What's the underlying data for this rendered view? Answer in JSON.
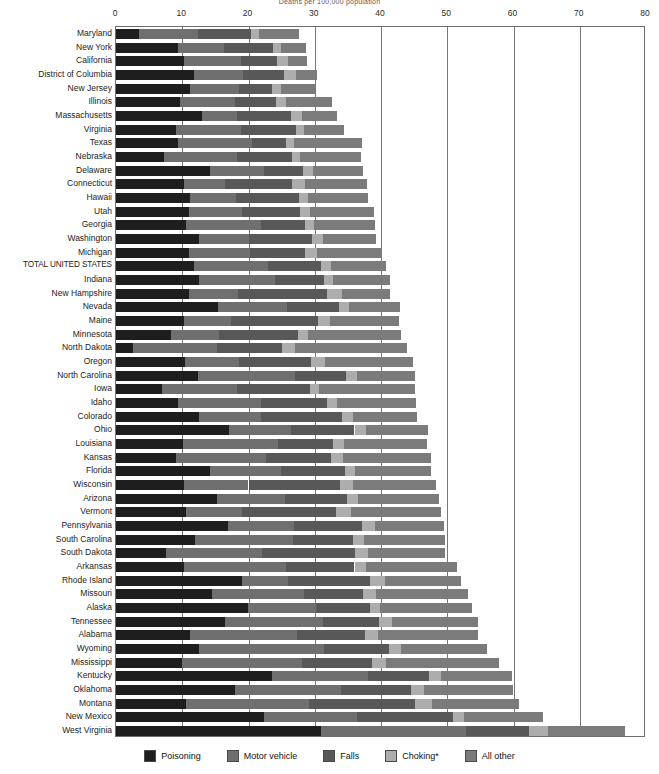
{
  "chart_data": {
    "type": "bar",
    "orientation": "horizontal",
    "stacked": true,
    "title": "",
    "subtitle": "Deaths per 100,000 population",
    "xlabel": "",
    "ylabel": "",
    "xlim": [
      0,
      80
    ],
    "xticks": [
      0,
      10,
      20,
      30,
      40,
      50,
      60,
      70,
      80
    ],
    "grid": "vertical",
    "legend_position": "bottom",
    "series": [
      {
        "name": "Poisoning",
        "color": "#1e1e1e"
      },
      {
        "name": "Motor vehicle",
        "color": "#6f6f6f"
      },
      {
        "name": "Falls",
        "color": "#585858"
      },
      {
        "name": "Choking*",
        "color": "#adadad"
      },
      {
        "name": "All other",
        "color": "#7b7b7b"
      }
    ],
    "categories": [
      "Maryland",
      "New York",
      "California",
      "District of Columbia",
      "New Jersey",
      "Illinois",
      "Massachusetts",
      "Virginia",
      "Texas",
      "Nebraska",
      "Delaware",
      "Connecticut",
      "Hawaii",
      "Utah",
      "Georgia",
      "Washington",
      "Michigan",
      "TOTAL UNITED STATES",
      "Indiana",
      "New Hampshire",
      "Nevada",
      "Maine",
      "Minnesota",
      "North Dakota",
      "Oregon",
      "North Carolina",
      "Iowa",
      "Idaho",
      "Colorado",
      "Ohio",
      "Louisiana",
      "Kansas",
      "Florida",
      "Wisconsin",
      "Arizona",
      "Vermont",
      "Pennsylvania",
      "South Carolina",
      "South Dakota",
      "Arkansas",
      "Rhode Island",
      "Missouri",
      "Alaska",
      "Tennessee",
      "Alabama",
      "Wyoming",
      "Mississippi",
      "Kentucky",
      "Oklahoma",
      "Montana",
      "New Mexico",
      "West Virginia"
    ],
    "values": [
      [
        3.5,
        8.9,
        8.0,
        1.2,
        6.0
      ],
      [
        9.4,
        6.9,
        7.4,
        1.2,
        3.8
      ],
      [
        10.3,
        8.6,
        5.4,
        1.7,
        2.8
      ],
      [
        11.8,
        7.3,
        6.2,
        1.9,
        3.2
      ],
      [
        11.1,
        7.4,
        5.1,
        1.3,
        5.2
      ],
      [
        9.7,
        8.3,
        6.2,
        1.4,
        7.0
      ],
      [
        13.0,
        5.2,
        8.2,
        1.7,
        5.3
      ],
      [
        9.1,
        9.7,
        8.3,
        1.3,
        6.0
      ],
      [
        9.3,
        11.2,
        5.2,
        1.2,
        10.2
      ],
      [
        7.2,
        11.1,
        8.2,
        1.2,
        9.3
      ],
      [
        14.2,
        8.1,
        5.9,
        1.5,
        7.6
      ],
      [
        10.2,
        6.2,
        10.1,
        2.1,
        9.3
      ],
      [
        11.1,
        7.0,
        9.5,
        1.4,
        9.1
      ],
      [
        11.0,
        8.0,
        8.8,
        1.5,
        9.7
      ],
      [
        10.5,
        11.4,
        6.6,
        1.4,
        9.2
      ],
      [
        12.5,
        7.5,
        9.6,
        1.7,
        8.0
      ],
      [
        11.0,
        9.2,
        8.4,
        1.7,
        9.9
      ],
      [
        11.8,
        11.1,
        8.0,
        1.5,
        8.3
      ],
      [
        12.6,
        11.4,
        7.4,
        1.4,
        8.5
      ],
      [
        11.0,
        7.4,
        13.4,
        2.3,
        7.2
      ],
      [
        15.4,
        10.4,
        7.9,
        1.4,
        7.7
      ],
      [
        10.2,
        7.2,
        13.1,
        1.8,
        10.4
      ],
      [
        8.3,
        7.3,
        11.8,
        1.6,
        14.0
      ],
      [
        2.5,
        12.7,
        9.9,
        1.9,
        16.9
      ],
      [
        10.4,
        8.2,
        10.9,
        2.0,
        13.3
      ],
      [
        12.4,
        14.6,
        7.7,
        1.7,
        8.7
      ],
      [
        6.9,
        11.4,
        11.0,
        1.4,
        14.4
      ],
      [
        9.4,
        12.5,
        9.9,
        1.5,
        12.0
      ],
      [
        12.6,
        9.3,
        12.2,
        1.7,
        9.7
      ],
      [
        17.0,
        9.4,
        9.6,
        1.7,
        9.4
      ],
      [
        10.1,
        14.3,
        8.4,
        1.6,
        12.5
      ],
      [
        9.0,
        13.7,
        9.8,
        1.8,
        13.2
      ],
      [
        14.2,
        10.7,
        9.6,
        1.6,
        11.5
      ],
      [
        10.2,
        9.8,
        13.8,
        1.9,
        12.6
      ],
      [
        15.2,
        10.3,
        9.4,
        1.6,
        12.3
      ],
      [
        10.5,
        8.5,
        14.2,
        2.2,
        13.7
      ],
      [
        16.9,
        9.9,
        10.3,
        2.0,
        10.4
      ],
      [
        11.9,
        14.8,
        9.0,
        1.7,
        12.3
      ],
      [
        7.5,
        14.5,
        14.0,
        2.0,
        11.6
      ],
      [
        10.3,
        15.3,
        10.4,
        1.7,
        13.7
      ],
      [
        19.0,
        6.9,
        12.5,
        2.2,
        11.5
      ],
      [
        14.5,
        13.9,
        8.9,
        2.0,
        13.9
      ],
      [
        19.9,
        10.3,
        8.2,
        1.5,
        13.8
      ],
      [
        16.5,
        14.8,
        8.4,
        2.0,
        13.0
      ],
      [
        11.1,
        16.2,
        10.3,
        2.0,
        15.0
      ],
      [
        12.6,
        18.8,
        9.8,
        1.8,
        13.0
      ],
      [
        9.9,
        18.2,
        10.6,
        2.0,
        17.1
      ],
      [
        23.6,
        14.4,
        9.2,
        1.9,
        10.6
      ],
      [
        18.0,
        16.0,
        10.5,
        2.0,
        13.4
      ],
      [
        10.5,
        18.6,
        16.1,
        2.5,
        13.2
      ],
      [
        22.4,
        14.0,
        14.4,
        1.8,
        11.9
      ],
      [
        31.0,
        21.9,
        9.4,
        2.9,
        11.6
      ]
    ]
  },
  "legend": {
    "items": [
      {
        "label": "Poisoning",
        "color": "#1e1e1e",
        "icon": "color-swatch-icon"
      },
      {
        "label": "Motor vehicle",
        "color": "#6f6f6f",
        "icon": "color-swatch-icon"
      },
      {
        "label": "Falls",
        "color": "#585858",
        "icon": "color-swatch-icon"
      },
      {
        "label": "Choking*",
        "color": "#adadad",
        "icon": "color-swatch-icon"
      },
      {
        "label": "All other",
        "color": "#7b7b7b",
        "icon": "color-swatch-icon"
      }
    ]
  }
}
